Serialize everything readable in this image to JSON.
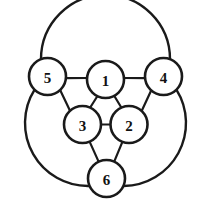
{
  "diagram": {
    "type": "node-link-diagram",
    "background_color": "#ffffff",
    "stroke_color": "#1a1a1a",
    "label_color": "#111111",
    "node_fill": "#ffffff",
    "node_radius": 18.5,
    "canvas": {
      "width": 204,
      "height": 207
    },
    "nodes": [
      {
        "id": "n1",
        "label": "1",
        "cx": 105.5,
        "cy": 79.5,
        "r": 18.5
      },
      {
        "id": "n2",
        "label": "2",
        "cx": 129.0,
        "cy": 124.5,
        "r": 18.5
      },
      {
        "id": "n3",
        "label": "3",
        "cx": 82.5,
        "cy": 124.5,
        "r": 18.5
      },
      {
        "id": "n4",
        "label": "4",
        "cx": 163.5,
        "cy": 76.5,
        "r": 18.5
      },
      {
        "id": "n5",
        "label": "5",
        "cx": 47.5,
        "cy": 76.5,
        "r": 18.5
      },
      {
        "id": "n6",
        "label": "6",
        "cx": 106.5,
        "cy": 178.5,
        "r": 18.5
      }
    ],
    "straight_edges": [
      {
        "from": "5",
        "to": "1"
      },
      {
        "from": "1",
        "to": "4"
      },
      {
        "from": "1",
        "to": "3"
      },
      {
        "from": "1",
        "to": "2"
      },
      {
        "from": "3",
        "to": "2"
      },
      {
        "from": "5",
        "to": "3"
      },
      {
        "from": "4",
        "to": "2"
      },
      {
        "from": "3",
        "to": "6"
      },
      {
        "from": "2",
        "to": "6"
      }
    ],
    "arc_edges": [
      {
        "from": "5",
        "to": "4",
        "position": "top",
        "apex": 13
      },
      {
        "from": "5",
        "to": "6",
        "position": "left",
        "extreme": 11
      },
      {
        "from": "4",
        "to": "6",
        "position": "right",
        "extreme": 193
      }
    ],
    "node_count": 6,
    "edge_count": 12
  }
}
